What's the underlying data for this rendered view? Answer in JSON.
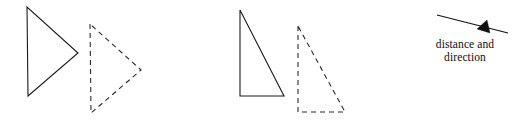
{
  "figure": {
    "background_color": "#ffffff",
    "stroke_color": "#1a1a1a",
    "width": 529,
    "height": 124,
    "caption_line_1": "distance and",
    "caption_line_2": "direction"
  },
  "shapes": {
    "pair_one": {
      "label": "left-triangle-pair",
      "preimage": {
        "style": "solid",
        "points": "27,7 28,96 78,53"
      },
      "image": {
        "style": "dashed",
        "points": "90,24 91,113 141,70"
      }
    },
    "pair_two": {
      "label": "middle-triangle-pair",
      "preimage": {
        "style": "solid",
        "points": "240,10 240,96 284,96"
      },
      "image": {
        "style": "dashed",
        "points": "298,26 298,112 345,112"
      }
    }
  },
  "vector": {
    "label": "distance-and-direction-vector",
    "line": {
      "x1": 437,
      "y1": 15,
      "x2": 508,
      "y2": 33
    },
    "head": "487,20 490,33 477,29"
  }
}
